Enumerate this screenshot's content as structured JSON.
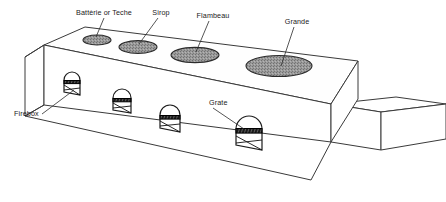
{
  "diagram": {
    "view": "oblique three-dimensional cutaway",
    "background_color": "#ffffff",
    "line_color": "#3a3a3a",
    "kettle_fill_color": "#9a9a9a",
    "grate_color": "#000000"
  },
  "kettles": [
    {
      "id": "kettle-batterie",
      "label": "Battèrie or Teche",
      "order": 1,
      "size_rank": "smallest",
      "center_x": 97,
      "center_y": 40,
      "rx": 14,
      "ry": 5.0,
      "label_x": 104,
      "label_y": 15,
      "label_anchor": "middle",
      "leader_from_x": 104,
      "leader_from_y": 18,
      "leader_to_x": 96,
      "leader_to_y": 37
    },
    {
      "id": "kettle-sirop",
      "label": "Sirop",
      "order": 2,
      "size_rank": "small",
      "center_x": 138,
      "center_y": 47,
      "rx": 19,
      "ry": 6.4,
      "label_x": 161,
      "label_y": 15,
      "label_anchor": "middle",
      "leader_from_x": 158,
      "leader_from_y": 18,
      "leader_to_x": 139,
      "leader_to_y": 44
    },
    {
      "id": "kettle-flambeau",
      "label": "Flambeau",
      "order": 3,
      "size_rank": "medium",
      "center_x": 195,
      "center_y": 55,
      "rx": 24,
      "ry": 7.6,
      "label_x": 213,
      "label_y": 18,
      "label_anchor": "middle",
      "leader_from_x": 209,
      "leader_from_y": 21,
      "leader_to_x": 196,
      "leader_to_y": 52
    },
    {
      "id": "kettle-grande",
      "label": "Grande",
      "order": 4,
      "size_rank": "largest",
      "center_x": 279,
      "center_y": 66,
      "rx": 33,
      "ry": 10.5,
      "label_x": 297,
      "label_y": 24,
      "label_anchor": "middle",
      "leader_from_x": 294,
      "leader_from_y": 27,
      "leader_to_x": 281,
      "leader_to_y": 66
    }
  ],
  "fireboxes": [
    {
      "id": "firebox-1",
      "x": 64,
      "y": 72,
      "width": 16,
      "height": 20,
      "grate_y_ratio": 0.42
    },
    {
      "id": "firebox-2",
      "x": 113,
      "y": 89,
      "width": 18,
      "height": 22,
      "grate_y_ratio": 0.42
    },
    {
      "id": "firebox-3",
      "x": 160,
      "y": 105,
      "width": 20,
      "height": 25,
      "grate_y_ratio": 0.42
    },
    {
      "id": "firebox-4",
      "x": 236,
      "y": 114,
      "width": 26,
      "height": 32,
      "grate_y_ratio": 0.42
    }
  ],
  "callouts": [
    {
      "id": "callout-firebox",
      "label": "Firebox",
      "label_x": 14,
      "label_y": 116,
      "label_anchor": "start",
      "leader_from_x": 42,
      "leader_from_y": 114,
      "leader_to_x": 74,
      "leader_to_y": 90
    },
    {
      "id": "callout-grate",
      "label": "Grate",
      "label_x": 209,
      "label_y": 105,
      "label_anchor": "start",
      "leader_from_x": 213,
      "leader_from_y": 108,
      "leader_to_x": 244,
      "leader_to_y": 129
    }
  ]
}
